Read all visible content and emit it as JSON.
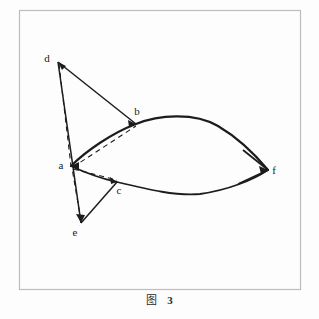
{
  "figure": {
    "caption_label": "图",
    "caption_number": "3",
    "frame": {
      "x": 19,
      "y": 10,
      "width": 281,
      "height": 279,
      "color": "#bdbdbd"
    },
    "background_color": "#fdfdfd",
    "stroke_color": "#1c1c1c"
  },
  "diagram": {
    "type": "geometry-line-diagram",
    "vertices": [
      {
        "id": "a",
        "label": "a",
        "x": 71,
        "y": 166,
        "label_x": 61,
        "label_y": 169
      },
      {
        "id": "b",
        "label": "b",
        "x": 136,
        "y": 124,
        "label_x": 137,
        "label_y": 115
      },
      {
        "id": "c",
        "label": "c",
        "x": 117,
        "y": 182,
        "label_x": 119,
        "label_y": 194
      },
      {
        "id": "d",
        "label": "d",
        "x": 58,
        "y": 62,
        "label_x": 47,
        "label_y": 62
      },
      {
        "id": "e",
        "label": "e",
        "x": 81,
        "y": 223,
        "label_x": 75,
        "label_y": 236
      },
      {
        "id": "f",
        "label": "f",
        "x": 268,
        "y": 170,
        "label_x": 274,
        "label_y": 174
      }
    ],
    "solid_segments": [
      {
        "name": "d-to-e",
        "from": "d",
        "to": "e"
      },
      {
        "name": "d-to-b",
        "from": "d",
        "to": "b"
      },
      {
        "name": "e-to-c",
        "from": "e",
        "to": "c"
      },
      {
        "name": "f-to-upper-arc-end",
        "from": "f",
        "to": "b"
      },
      {
        "name": "f-to-lower-arc-end",
        "from": "f",
        "to": "c"
      }
    ],
    "dashed_segments": [
      {
        "name": "d-to-a",
        "from": "d",
        "to": "a"
      },
      {
        "name": "a-to-b",
        "from": "a",
        "to": "b"
      },
      {
        "name": "a-to-c",
        "from": "a",
        "to": "c"
      },
      {
        "name": "e-to-a",
        "from": "e",
        "to": "a"
      }
    ],
    "arcs": [
      {
        "name": "arc-a-b-f-upper",
        "from": "a",
        "through": "b",
        "to": "f",
        "apex_x": 186,
        "apex_y": 117
      },
      {
        "name": "arc-a-c-f-lower",
        "from": "a",
        "through": "c",
        "to": "f",
        "apex_x": 190,
        "apex_y": 196
      }
    ],
    "arrowheads": [
      {
        "name": "arrowhead-at-d",
        "at": "d"
      },
      {
        "name": "arrowhead-at-b",
        "at": "b"
      },
      {
        "name": "arrowhead-at-c",
        "at": "c"
      },
      {
        "name": "arrowhead-at-a",
        "at": "a"
      },
      {
        "name": "arrowhead-at-e",
        "at": "e"
      },
      {
        "name": "arrowhead-at-f",
        "at": "f"
      }
    ]
  }
}
